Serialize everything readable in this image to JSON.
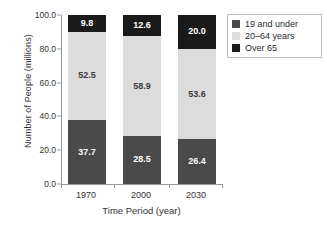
{
  "chart_data": {
    "type": "bar",
    "subtype": "stacked-bar",
    "title": "",
    "xlabel": "Time Period (year)",
    "ylabel": "Number of People (millions)",
    "categories": [
      "1970",
      "2000",
      "2030"
    ],
    "ylim": [
      0.0,
      100.0
    ],
    "ytick_labels": [
      "0.0",
      "20.0",
      "40.0",
      "60.0",
      "80.0",
      "100.0"
    ],
    "yticks": [
      0,
      20,
      40,
      60,
      80,
      100
    ],
    "grid": false,
    "legend_position": "top-right",
    "stacked_totals": [
      100.0,
      100.0,
      100.0
    ],
    "series": [
      {
        "name": "19 and under",
        "color": "#4a4a4a",
        "label_color": "#ffffff",
        "values": [
          37.7,
          28.5,
          26.4
        ],
        "value_labels": [
          "37.7",
          "28.5",
          "26.4"
        ]
      },
      {
        "name": "20–64 years",
        "color": "#dcdcdc",
        "label_color": "#3d3d3d",
        "values": [
          52.5,
          58.9,
          53.6
        ],
        "value_labels": [
          "52.5",
          "58.9",
          "53.6"
        ]
      },
      {
        "name": "Over 65",
        "color": "#1a1a1a",
        "label_color": "#ffffff",
        "values": [
          9.8,
          12.6,
          20.0
        ],
        "value_labels": [
          "9.8",
          "12.6",
          "20.0"
        ]
      }
    ]
  },
  "axes": {
    "y_title": "Number of People (millions)",
    "x_title": "Time Period (year)",
    "y_tick_0": "0.0",
    "y_tick_1": "20.0",
    "y_tick_2": "40.0",
    "y_tick_3": "60.0",
    "y_tick_4": "80.0",
    "y_tick_5": "100.0",
    "x_tick_0": "1970",
    "x_tick_1": "2000",
    "x_tick_2": "2030"
  },
  "legend": {
    "items": [
      {
        "label": "19 and under",
        "color": "#4a4a4a"
      },
      {
        "label": "20–64 years",
        "color": "#dcdcdc"
      },
      {
        "label": "Over 65",
        "color": "#1a1a1a"
      }
    ]
  },
  "bars": [
    {
      "category": "1970",
      "segments": [
        {
          "series": "19 and under",
          "value_label": "37.7"
        },
        {
          "series": "20–64 years",
          "value_label": "52.5"
        },
        {
          "series": "Over 65",
          "value_label": "9.8"
        }
      ]
    },
    {
      "category": "2000",
      "segments": [
        {
          "series": "19 and under",
          "value_label": "28.5"
        },
        {
          "series": "20–64 years",
          "value_label": "58.9"
        },
        {
          "series": "Over 65",
          "value_label": "12.6"
        }
      ]
    },
    {
      "category": "2030",
      "segments": [
        {
          "series": "19 and under",
          "value_label": "26.4"
        },
        {
          "series": "20–64 years",
          "value_label": "53.6"
        },
        {
          "series": "Over 65",
          "value_label": "20.0"
        }
      ]
    }
  ]
}
